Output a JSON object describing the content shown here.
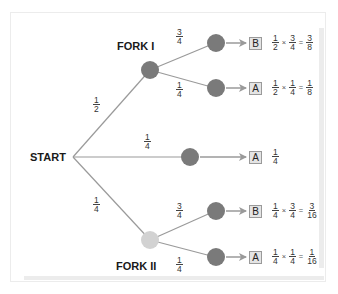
{
  "diagram": {
    "type": "probability-tree",
    "colors": {
      "edge": "#9a9a9a",
      "node_dark": "#7a7a7a",
      "node_light": "#d2d2d2",
      "box_fill": "#e4e4e4",
      "box_border": "#9a9a9a"
    },
    "labels": {
      "start": "START",
      "fork1": "FORK I",
      "fork2": "FORK II"
    },
    "branches": {
      "start_to_fork1": {
        "num": "1",
        "den": "2"
      },
      "start_to_middle": {
        "num": "1",
        "den": "4"
      },
      "start_to_fork2": {
        "num": "1",
        "den": "4"
      },
      "fork1_top": {
        "num": "3",
        "den": "4"
      },
      "fork1_bottom": {
        "num": "1",
        "den": "4"
      },
      "fork2_top": {
        "num": "3",
        "den": "4"
      },
      "fork2_bottom": {
        "num": "1",
        "den": "4"
      }
    },
    "outcomes": [
      {
        "letter": "B",
        "a": {
          "num": "1",
          "den": "2"
        },
        "op": "×",
        "b": {
          "num": "3",
          "den": "4"
        },
        "eq": "=",
        "r": {
          "num": "3",
          "den": "8"
        }
      },
      {
        "letter": "A",
        "a": {
          "num": "1",
          "den": "2"
        },
        "op": "×",
        "b": {
          "num": "1",
          "den": "4"
        },
        "eq": "=",
        "r": {
          "num": "1",
          "den": "8"
        }
      },
      {
        "letter": "A",
        "r": {
          "num": "1",
          "den": "4"
        }
      },
      {
        "letter": "B",
        "a": {
          "num": "1",
          "den": "4"
        },
        "op": "×",
        "b": {
          "num": "3",
          "den": "4"
        },
        "eq": "=",
        "r": {
          "num": "3",
          "den": "16"
        }
      },
      {
        "letter": "A",
        "a": {
          "num": "1",
          "den": "4"
        },
        "op": "×",
        "b": {
          "num": "1",
          "den": "4"
        },
        "eq": "=",
        "r": {
          "num": "1",
          "den": "16"
        }
      }
    ]
  }
}
